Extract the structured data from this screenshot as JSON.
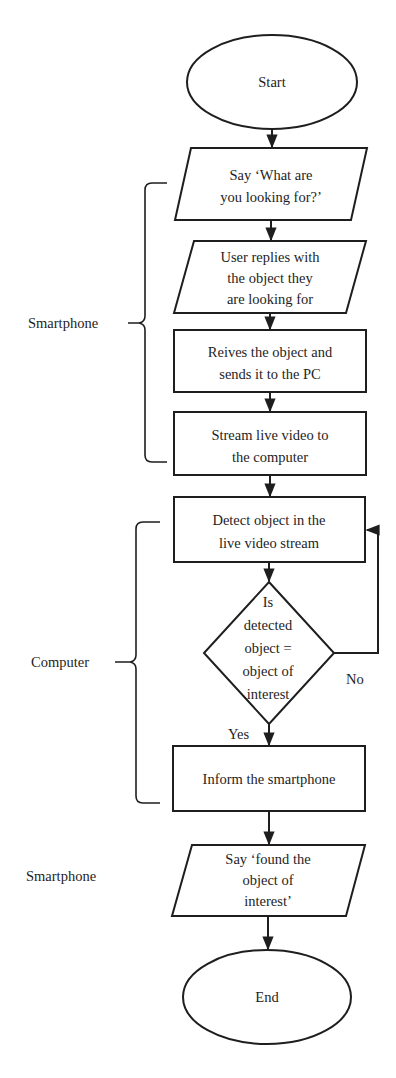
{
  "diagram": {
    "type": "flowchart",
    "nodes": {
      "start": {
        "shape": "ellipse",
        "label": "Start"
      },
      "say_what": {
        "shape": "parallelogram",
        "lines": [
          "Say ‘What are",
          "you looking for?’"
        ]
      },
      "user_replies": {
        "shape": "parallelogram",
        "lines": [
          "User replies with",
          "the object they",
          "are looking for"
        ]
      },
      "receives": {
        "shape": "rectangle",
        "lines": [
          "Reives the object and",
          "sends it to the PC"
        ]
      },
      "stream": {
        "shape": "rectangle",
        "lines": [
          "Stream live video to",
          "the computer"
        ]
      },
      "detect": {
        "shape": "rectangle",
        "lines": [
          "Detect object in the",
          "live video stream"
        ]
      },
      "decision": {
        "shape": "diamond",
        "lines": [
          "Is",
          "detected",
          "object  =",
          "object of",
          "interest"
        ]
      },
      "inform": {
        "shape": "rectangle",
        "label": "Inform the smartphone"
      },
      "say_found": {
        "shape": "parallelogram",
        "lines": [
          "Say ‘found the",
          "object of",
          "interest’"
        ]
      },
      "end": {
        "shape": "ellipse",
        "label": "End"
      }
    },
    "edges": [
      {
        "from": "start",
        "to": "say_what"
      },
      {
        "from": "say_what",
        "to": "user_replies"
      },
      {
        "from": "user_replies",
        "to": "receives"
      },
      {
        "from": "receives",
        "to": "stream"
      },
      {
        "from": "stream",
        "to": "detect"
      },
      {
        "from": "detect",
        "to": "decision"
      },
      {
        "from": "decision",
        "to": "inform",
        "label": "Yes"
      },
      {
        "from": "decision",
        "to": "detect",
        "label": "No"
      },
      {
        "from": "inform",
        "to": "say_found"
      },
      {
        "from": "say_found",
        "to": "end"
      }
    ],
    "edge_labels": {
      "yes": "Yes",
      "no": "No"
    },
    "groups": [
      {
        "label": "Smartphone",
        "members": [
          "say_what",
          "user_replies",
          "receives",
          "stream"
        ]
      },
      {
        "label": "Computer",
        "members": [
          "detect",
          "decision",
          "inform"
        ]
      },
      {
        "label": "Smartphone",
        "members": [
          "say_found"
        ]
      }
    ],
    "colors": {
      "stroke": "#1e1e1e",
      "background": "#ffffff"
    }
  }
}
